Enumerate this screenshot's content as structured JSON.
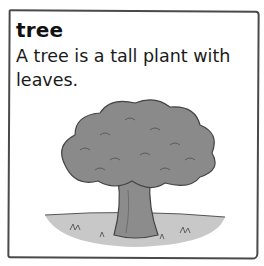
{
  "card": {
    "word": "tree",
    "definition": " A tree is a tall plant with leaves.",
    "illustration": "tree-illustration"
  },
  "colors": {
    "border": "#4a4a4a",
    "text": "#111111",
    "foliage": "#8a8a8a",
    "trunk": "#7a7a7a",
    "ground": "#b5b5b5"
  }
}
